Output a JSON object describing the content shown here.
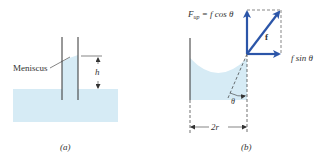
{
  "panel_a": {
    "caption": "(a)",
    "meniscus_label": "Meniscus",
    "height_label": "h"
  },
  "panel_b": {
    "caption": "(b)",
    "fup_label": "F",
    "fup_sub": "up",
    "fup_eq": " = f cos θ",
    "force_label": "f",
    "fsin_label": "f sin θ",
    "theta_label": "θ",
    "width_label": "2r"
  },
  "colors": {
    "water": "#d6ebf5",
    "arrow": "#2b55a8",
    "line": "#333333"
  }
}
